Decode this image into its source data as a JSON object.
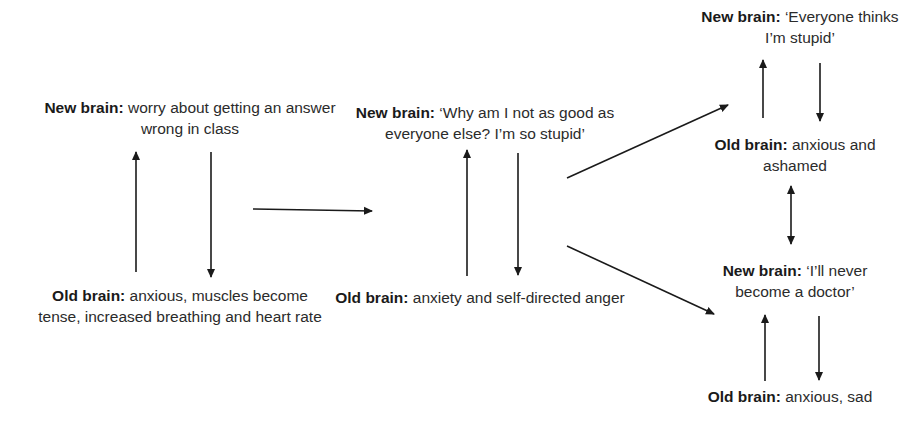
{
  "diagram": {
    "stage1": {
      "new_brain": {
        "label": "New brain:",
        "text": " worry about getting an answer wrong in class"
      },
      "old_brain": {
        "label": "Old brain:",
        "text": " anxious, muscles become tense, increased breathing and heart rate"
      }
    },
    "stage2": {
      "new_brain": {
        "label": "New brain:",
        "text": " ‘Why am I not as good as everyone else? I’m so stupid’"
      },
      "old_brain": {
        "label": "Old brain:",
        "text": " anxiety and self-directed anger"
      }
    },
    "stage3a": {
      "new_brain": {
        "label": "New brain:",
        "text": " ‘Everyone thinks I’m stupid’"
      },
      "old_brain": {
        "label": "Old brain:",
        "text": " anxious and ashamed"
      }
    },
    "stage3b": {
      "new_brain": {
        "label": "New brain:",
        "text": " ‘I’ll never become a doctor’"
      },
      "old_brain": {
        "label": "Old brain:",
        "text": " anxious, sad"
      }
    }
  }
}
